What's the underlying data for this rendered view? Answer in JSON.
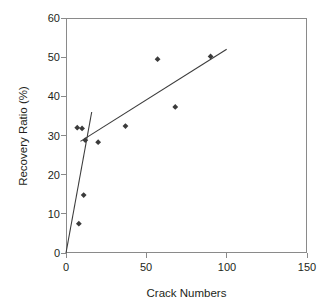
{
  "chart_data": {
    "type": "scatter",
    "title": "",
    "xlabel": "Crack Numbers",
    "ylabel": "Recovery Ratio (%)",
    "xlim": [
      0,
      150
    ],
    "ylim": [
      0,
      60
    ],
    "xticks": [
      0,
      50,
      100,
      150
    ],
    "yticks": [
      0,
      10,
      20,
      30,
      40,
      50,
      60
    ],
    "grid": false,
    "legend": null,
    "marker": "diamond",
    "marker_color": "#3b3b3b",
    "points": [
      {
        "x": 7,
        "y": 32.0
      },
      {
        "x": 10,
        "y": 31.8
      },
      {
        "x": 12,
        "y": 28.8
      },
      {
        "x": 20,
        "y": 28.3
      },
      {
        "x": 37,
        "y": 32.4
      },
      {
        "x": 57,
        "y": 49.5
      },
      {
        "x": 68,
        "y": 37.3
      },
      {
        "x": 90,
        "y": 50.2
      },
      {
        "x": 11,
        "y": 14.8
      },
      {
        "x": 8,
        "y": 7.5
      }
    ],
    "series": [
      {
        "name": "steep-trend-line",
        "type": "line",
        "color": "#3b3b3b",
        "x": [
          0,
          16
        ],
        "y": [
          0,
          36.0
        ]
      },
      {
        "name": "shallow-trend-line",
        "type": "line",
        "color": "#3b3b3b",
        "x": [
          9,
          100
        ],
        "y": [
          28.5,
          52.0
        ]
      }
    ]
  },
  "axes": {
    "x_title": "Crack Numbers",
    "y_title": "Recovery Ratio (%)",
    "x_tick_labels": [
      "0",
      "50",
      "100",
      "150"
    ],
    "y_tick_labels": [
      "0",
      "10",
      "20",
      "30",
      "40",
      "50",
      "60"
    ]
  },
  "style": {
    "frame_color": "#8a8a8a",
    "text_color": "#231f20",
    "background": "#ffffff"
  }
}
